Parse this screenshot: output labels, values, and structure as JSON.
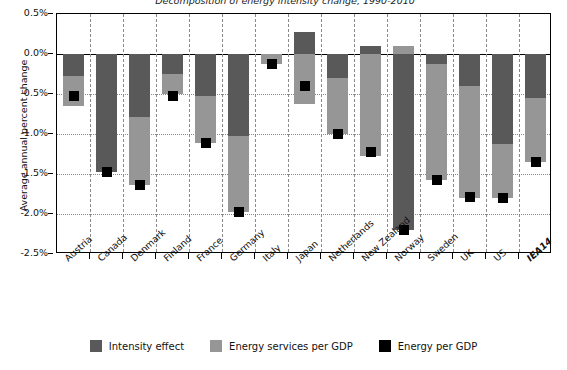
{
  "chart_title": "Decomposition of energy intensity change, 1990-2010",
  "axis": {
    "ylabel": "Average annual percent change",
    "yticks": [
      "0.5%",
      "0.0%",
      "-0.5%",
      "-1.0%",
      "-1.5%",
      "-2.0%",
      "-2.5%"
    ],
    "xlabel": ""
  },
  "legend": {
    "items": [
      {
        "label": "Intensity effect",
        "color": "#595959",
        "swatch": "intensity-swatch"
      },
      {
        "label": "Energy services per GDP",
        "color": "#969696",
        "swatch": "services-swatch"
      },
      {
        "label": "Energy per GDP",
        "color": "#000000",
        "swatch": "energy-swatch"
      }
    ]
  },
  "colors": {
    "intensity": "#595959",
    "services": "#969696",
    "marker": "#000000",
    "grid": "#8a8a8a",
    "axis": "#000000",
    "background": "#ffffff"
  },
  "chart_data": {
    "type": "bar",
    "title": "Decomposition of energy intensity change, 1990-2010",
    "subtype": "stacked-bar-with-marker",
    "xlabel": "",
    "ylabel": "Average annual percent change",
    "ylim": [
      -2.5,
      0.5
    ],
    "yticks": [
      0.5,
      0.0,
      -0.5,
      -1.0,
      -1.5,
      -2.0,
      -2.5
    ],
    "ytick_format": "percent",
    "grid": "horizontal-dotted-and-vertical-dashed",
    "legend_position": "bottom-center",
    "units": "Average annual percent change",
    "categories": [
      "Austria",
      "Canada",
      "Denmark",
      "Finland",
      "France",
      "Germany",
      "Italy",
      "Japan",
      "Netherlands",
      "New Zealand",
      "Norway",
      "Sweden",
      "UK",
      "US",
      "IEA14"
    ],
    "series": [
      {
        "name": "Intensity effect",
        "color": "#595959",
        "values": [
          -0.27,
          -1.48,
          -0.79,
          -0.25,
          -0.53,
          -1.03,
          0.0,
          0.27,
          -0.3,
          0.1,
          -2.2,
          -0.13,
          -0.4,
          -1.12,
          -0.55
        ]
      },
      {
        "name": "Energy services per GDP",
        "color": "#969696",
        "values": [
          -0.38,
          0.0,
          -0.85,
          -0.25,
          -0.58,
          -0.95,
          -0.13,
          -0.62,
          -0.7,
          -1.27,
          0.1,
          -1.45,
          -1.4,
          -0.68,
          -0.8
        ]
      },
      {
        "name": "Energy per GDP",
        "color": "#000000",
        "marker": "square",
        "values": [
          -0.53,
          -1.48,
          -1.64,
          -0.52,
          -1.11,
          -1.98,
          -0.13,
          -0.4,
          -1.0,
          -1.23,
          -2.2,
          -1.57,
          -1.79,
          -1.8,
          -1.35
        ]
      }
    ]
  }
}
